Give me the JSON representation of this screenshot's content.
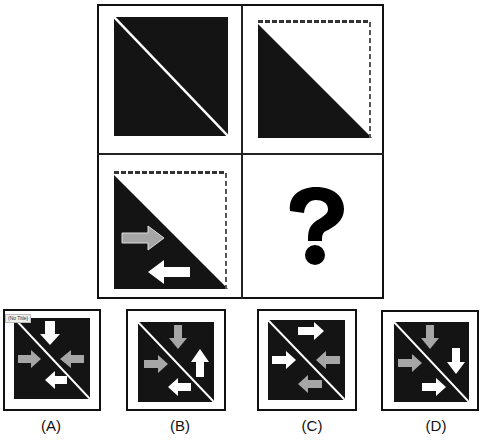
{
  "puzzle": {
    "question_mark": "?",
    "cells": [
      {
        "id": "cell-1",
        "description": "black square with white diagonal line"
      },
      {
        "id": "cell-2",
        "description": "black lower-left triangle, white upper-right triangle with dashed border"
      },
      {
        "id": "cell-3",
        "description": "black lower-left triangle with gray right arrow and white left arrow"
      },
      {
        "id": "cell-4",
        "description": "question mark"
      }
    ]
  },
  "options": [
    {
      "label": "(A)",
      "tooltip": "(No Title)"
    },
    {
      "label": "(B)"
    },
    {
      "label": "(C)"
    },
    {
      "label": "(D)"
    }
  ],
  "colors": {
    "fill": "#141414",
    "gray_arrow": "#a6a6a6",
    "white_arrow": "#ffffff",
    "border": "#111111"
  }
}
